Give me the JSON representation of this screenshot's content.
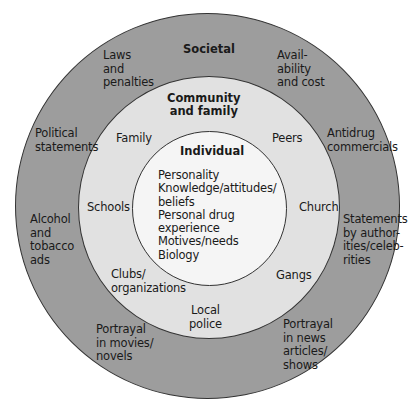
{
  "diagram": {
    "type": "concentric-circles",
    "colors": {
      "background": "#ffffff",
      "societal_ring": "#9d9d9d",
      "community_ring": "#e1e1e1",
      "individual_circle": "#f5f5f5",
      "outline": "#333333",
      "text": "#1a1a1a"
    },
    "societal": {
      "title": "Societal",
      "items": [
        "Laws\nand\npenalties",
        "Avail-\nability\nand cost",
        "Political\nstatements",
        "Antidrug\ncommercials",
        "Alcohol\nand\ntobacco\nads",
        "Statements\nby author-\nities/celeb-\nrities",
        "Portrayal\nin movies/\nnovels",
        "Portrayal\nin news\narticles/\nshows"
      ]
    },
    "community": {
      "title": "Community\nand family",
      "items": [
        "Family",
        "Peers",
        "Schools",
        "Church",
        "Clubs/\norganizations",
        "Gangs",
        "Local\npolice"
      ]
    },
    "individual": {
      "title": "Individual",
      "items": [
        "Personality\nKnowledge/attitudes/\nbeliefs\nPersonal drug\nexperience\nMotives/needs\nBiology"
      ]
    }
  }
}
